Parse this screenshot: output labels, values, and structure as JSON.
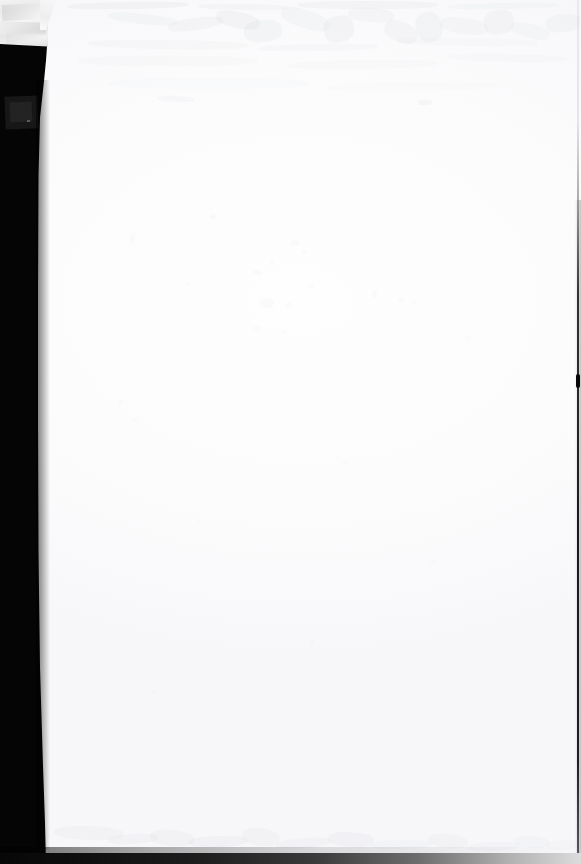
{
  "document": {
    "kind": "scanned-page",
    "page_content_text": "",
    "visible_text": "",
    "caption": "Blank scanned page",
    "width_px": 581,
    "height_px": 864
  },
  "colors": {
    "paper": "#fefefe",
    "paper_tone": "#f9f9fb",
    "scan_shadow": "#050505",
    "scan_shadow_inner": "#171717",
    "lid_patch_light": "#f3f3f3",
    "lid_patch_dark": "#dddddd",
    "edge_line": "#0a0a0a",
    "smudge": "#c4c6cb"
  },
  "regions": {
    "lid_patch": {
      "name": "scanner-lid-patch",
      "x": 0,
      "y": 0,
      "width": 48,
      "height": 47
    },
    "left_shadow": {
      "name": "left-scan-shadow",
      "x": 0,
      "y": 44,
      "width": 50,
      "height": 820
    },
    "left_shadow_inner": {
      "name": "left-scan-shadow-inner-block",
      "x": 5,
      "y": 96,
      "width": 33,
      "height": 33
    },
    "bottom_shadow": {
      "name": "bottom-scan-shadow",
      "x": 0,
      "y": 853,
      "width": 581,
      "height": 11
    },
    "right_edge_line": {
      "name": "right-page-edge-line",
      "x": 577,
      "y": 0,
      "width": 2,
      "height": 864
    },
    "right_edge_blob": {
      "name": "right-edge-artifact",
      "x": 576,
      "y": 374,
      "width": 4,
      "height": 14
    }
  },
  "smudges": [
    {
      "x": 20,
      "y": 2,
      "w": 120,
      "h": 7,
      "rot": -1,
      "op": 0.3
    },
    {
      "x": 150,
      "y": 4,
      "w": 90,
      "h": 6,
      "rot": 1,
      "op": 0.22
    },
    {
      "x": 250,
      "y": 1,
      "w": 140,
      "h": 8,
      "rot": 0,
      "op": 0.26
    },
    {
      "x": 400,
      "y": 3,
      "w": 110,
      "h": 6,
      "rot": -1,
      "op": 0.2
    },
    {
      "x": 60,
      "y": 14,
      "w": 70,
      "h": 10,
      "rot": 6,
      "op": 0.24
    },
    {
      "x": 120,
      "y": 18,
      "w": 55,
      "h": 12,
      "rot": -8,
      "op": 0.26
    },
    {
      "x": 168,
      "y": 12,
      "w": 44,
      "h": 16,
      "rot": 12,
      "op": 0.3
    },
    {
      "x": 196,
      "y": 20,
      "w": 38,
      "h": 22,
      "rot": -5,
      "op": 0.28
    },
    {
      "x": 232,
      "y": 10,
      "w": 50,
      "h": 18,
      "rot": 18,
      "op": 0.24
    },
    {
      "x": 276,
      "y": 16,
      "w": 30,
      "h": 26,
      "rot": -14,
      "op": 0.3
    },
    {
      "x": 300,
      "y": 8,
      "w": 46,
      "h": 14,
      "rot": 4,
      "op": 0.22
    },
    {
      "x": 336,
      "y": 22,
      "w": 34,
      "h": 20,
      "rot": 22,
      "op": 0.26
    },
    {
      "x": 368,
      "y": 12,
      "w": 26,
      "h": 30,
      "rot": -18,
      "op": 0.28
    },
    {
      "x": 392,
      "y": 18,
      "w": 48,
      "h": 16,
      "rot": 8,
      "op": 0.22
    },
    {
      "x": 436,
      "y": 10,
      "w": 30,
      "h": 24,
      "rot": -10,
      "op": 0.26
    },
    {
      "x": 462,
      "y": 24,
      "w": 40,
      "h": 14,
      "rot": 14,
      "op": 0.2
    },
    {
      "x": 498,
      "y": 14,
      "w": 34,
      "h": 18,
      "rot": -6,
      "op": 0.24
    },
    {
      "x": 40,
      "y": 40,
      "w": 160,
      "h": 9,
      "rot": 1,
      "op": 0.18
    },
    {
      "x": 210,
      "y": 44,
      "w": 120,
      "h": 7,
      "rot": -1,
      "op": 0.16
    },
    {
      "x": 350,
      "y": 38,
      "w": 140,
      "h": 8,
      "rot": 1,
      "op": 0.15
    },
    {
      "x": 30,
      "y": 56,
      "w": 180,
      "h": 10,
      "rot": 0,
      "op": 0.14
    },
    {
      "x": 240,
      "y": 60,
      "w": 150,
      "h": 9,
      "rot": -1,
      "op": 0.13
    },
    {
      "x": 400,
      "y": 54,
      "w": 120,
      "h": 8,
      "rot": 1,
      "op": 0.12
    },
    {
      "x": 60,
      "y": 78,
      "w": 200,
      "h": 11,
      "rot": 0,
      "op": 0.11
    },
    {
      "x": 280,
      "y": 82,
      "w": 170,
      "h": 9,
      "rot": -1,
      "op": 0.1
    },
    {
      "x": 110,
      "y": 96,
      "w": 36,
      "h": 6,
      "rot": 2,
      "op": 0.22
    },
    {
      "x": 370,
      "y": 100,
      "w": 14,
      "h": 5,
      "rot": 0,
      "op": 0.26
    }
  ],
  "specks": [
    {
      "x": 210,
      "y": 214,
      "w": 6,
      "h": 5,
      "op": 0.2
    },
    {
      "x": 130,
      "y": 234,
      "w": 5,
      "h": 10,
      "op": 0.16
    },
    {
      "x": 290,
      "y": 240,
      "w": 9,
      "h": 6,
      "op": 0.24
    },
    {
      "x": 302,
      "y": 250,
      "w": 5,
      "h": 4,
      "op": 0.18
    },
    {
      "x": 270,
      "y": 258,
      "w": 4,
      "h": 8,
      "op": 0.15
    },
    {
      "x": 252,
      "y": 270,
      "w": 10,
      "h": 5,
      "op": 0.22
    },
    {
      "x": 186,
      "y": 282,
      "w": 5,
      "h": 5,
      "op": 0.18
    },
    {
      "x": 308,
      "y": 284,
      "w": 6,
      "h": 4,
      "op": 0.16
    },
    {
      "x": 372,
      "y": 290,
      "w": 5,
      "h": 9,
      "op": 0.2
    },
    {
      "x": 398,
      "y": 298,
      "w": 7,
      "h": 5,
      "op": 0.17
    },
    {
      "x": 260,
      "y": 298,
      "w": 14,
      "h": 10,
      "op": 0.22
    },
    {
      "x": 286,
      "y": 302,
      "w": 6,
      "h": 6,
      "op": 0.15
    },
    {
      "x": 412,
      "y": 300,
      "w": 4,
      "h": 4,
      "op": 0.14
    },
    {
      "x": 252,
      "y": 326,
      "w": 10,
      "h": 6,
      "op": 0.18
    },
    {
      "x": 282,
      "y": 330,
      "w": 5,
      "h": 5,
      "op": 0.14
    },
    {
      "x": 118,
      "y": 400,
      "w": 5,
      "h": 5,
      "op": 0.16
    },
    {
      "x": 132,
      "y": 418,
      "w": 6,
      "h": 4,
      "op": 0.13
    },
    {
      "x": 466,
      "y": 336,
      "w": 5,
      "h": 5,
      "op": 0.12
    },
    {
      "x": 342,
      "y": 460,
      "w": 6,
      "h": 5,
      "op": 0.12
    },
    {
      "x": 196,
      "y": 520,
      "w": 5,
      "h": 4,
      "op": 0.11
    },
    {
      "x": 430,
      "y": 560,
      "w": 6,
      "h": 5,
      "op": 0.1
    },
    {
      "x": 310,
      "y": 640,
      "w": 5,
      "h": 5,
      "op": 0.1
    },
    {
      "x": 150,
      "y": 690,
      "w": 6,
      "h": 4,
      "op": 0.1
    }
  ],
  "bottom_smudges": [
    {
      "x": 6,
      "y": 36,
      "w": 70,
      "h": 14,
      "rot": 2,
      "op": 0.22
    },
    {
      "x": 60,
      "y": 44,
      "w": 50,
      "h": 10,
      "rot": -3,
      "op": 0.2
    },
    {
      "x": 102,
      "y": 40,
      "w": 44,
      "h": 16,
      "rot": 5,
      "op": 0.26
    },
    {
      "x": 140,
      "y": 46,
      "w": 60,
      "h": 11,
      "rot": -2,
      "op": 0.24
    },
    {
      "x": 194,
      "y": 38,
      "w": 38,
      "h": 18,
      "rot": 8,
      "op": 0.22
    },
    {
      "x": 228,
      "y": 48,
      "w": 56,
      "h": 10,
      "rot": -4,
      "op": 0.2
    },
    {
      "x": 280,
      "y": 42,
      "w": 46,
      "h": 15,
      "rot": 3,
      "op": 0.24
    },
    {
      "x": 322,
      "y": 50,
      "w": 62,
      "h": 9,
      "rot": -1,
      "op": 0.18
    },
    {
      "x": 380,
      "y": 44,
      "w": 40,
      "h": 14,
      "rot": 6,
      "op": 0.22
    },
    {
      "x": 418,
      "y": 52,
      "w": 54,
      "h": 9,
      "rot": -2,
      "op": 0.16
    },
    {
      "x": 466,
      "y": 46,
      "w": 36,
      "h": 12,
      "rot": 4,
      "op": 0.18
    },
    {
      "x": 498,
      "y": 50,
      "w": 34,
      "h": 10,
      "rot": -3,
      "op": 0.14
    }
  ]
}
